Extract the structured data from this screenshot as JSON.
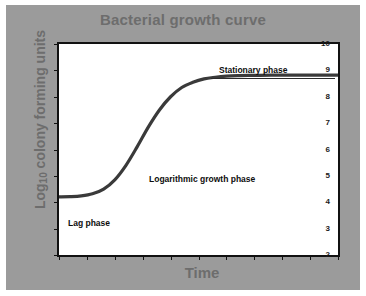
{
  "figure": {
    "background_color": "#9b9b9b",
    "panel_color": "#9b9b9b",
    "plot_background": "#ffffff",
    "frame_color": "#111111",
    "title_color": "#6d6d6d",
    "axis_label_color": "#6d6d6d",
    "annotation_color": "#0d0d0d",
    "curve_color": "#3a3a3a"
  },
  "chart_data": {
    "type": "line",
    "title": "Bacterial growth curve",
    "xlabel": "Time",
    "ylabel_prefix": "Log",
    "ylabel_subscript": "10",
    "ylabel_suffix": " colony forming units",
    "ylabel_full": "Log10 colony forming units",
    "ylim": [
      2,
      10
    ],
    "yticks": [
      10,
      9,
      8,
      7,
      6,
      5,
      4,
      3,
      2
    ],
    "ytick_labels": [
      "10",
      "9",
      "8",
      "7",
      "6",
      "5",
      "4",
      "3",
      "2"
    ],
    "xlim": [
      0,
      10
    ],
    "xticks": [
      0,
      1,
      2,
      3,
      4,
      5,
      6,
      7,
      8,
      9,
      10
    ],
    "xtick_labels": [
      "",
      "",
      "",
      "",
      "",
      "",
      "",
      "",
      "",
      "",
      ""
    ],
    "grid": false,
    "legend": null,
    "series": [
      {
        "name": "Bacterial growth",
        "x": [
          0.0,
          0.4,
          0.8,
          1.2,
          1.6,
          2.0,
          2.4,
          2.8,
          3.2,
          3.6,
          4.0,
          4.4,
          4.8,
          5.2,
          5.6,
          6.0,
          6.4,
          7.0,
          7.6,
          8.2,
          8.8,
          9.4,
          10.0
        ],
        "y": [
          4.2,
          4.21,
          4.24,
          4.32,
          4.5,
          4.85,
          5.4,
          6.1,
          6.85,
          7.5,
          8.0,
          8.35,
          8.55,
          8.68,
          8.74,
          8.78,
          8.8,
          8.81,
          8.82,
          8.82,
          8.82,
          8.82,
          8.82
        ]
      }
    ],
    "annotations": [
      {
        "id": "stationary",
        "text": "Stationary phase",
        "x": 6.2,
        "y": 9.15
      },
      {
        "id": "logarithmic",
        "text": "Logarithmic growth phase",
        "x": 4.0,
        "y": 5.15
      },
      {
        "id": "lag",
        "text": "Lag phase",
        "x": 0.5,
        "y": 3.55
      }
    ]
  }
}
